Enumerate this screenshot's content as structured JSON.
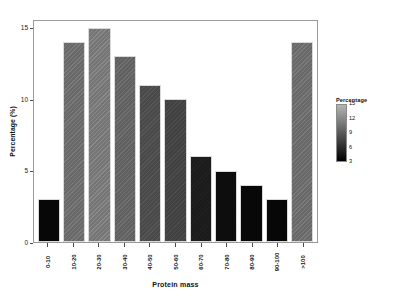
{
  "chart_data": {
    "type": "bar",
    "title": "",
    "xlabel": "Protein mass",
    "ylabel": "Percentage (%)",
    "categories": [
      "0-10",
      "10-20",
      "20-30",
      "30-40",
      "40-50",
      "50-60",
      "60-70",
      "70-80",
      "80-90",
      "90-100",
      ">100"
    ],
    "values": [
      3,
      14,
      15,
      13,
      11,
      10,
      6,
      5,
      4,
      3,
      14
    ],
    "ylim": [
      0,
      15.6
    ],
    "yticks": [
      0,
      5,
      10,
      15
    ],
    "ytick_labels": [
      "0",
      "5",
      "10",
      "15"
    ],
    "xtick_rotation": 90,
    "grid": false,
    "legend": {
      "title": "Percentage",
      "position": "right",
      "type": "continuous-colorbar",
      "ticks": [
        15,
        12,
        9,
        6,
        3
      ],
      "tick_labels": [
        "15",
        "12",
        "9",
        "6",
        "3"
      ],
      "vmin": 3,
      "vmax": 15,
      "color_low": "#000000",
      "color_high": "#b4b4b4"
    },
    "bar_colors": [
      "#070707",
      "#6f6f6f",
      "#7c7c7c",
      "#666666",
      "#4e4e4e",
      "#454545",
      "#1d1d1d",
      "#0d0d0d",
      "#080808",
      "#070707",
      "#6f6f6f"
    ]
  },
  "figure": {
    "panel_border_color": "#9a9a9a",
    "background": "#ffffff"
  }
}
